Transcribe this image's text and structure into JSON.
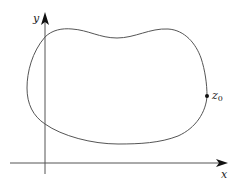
{
  "diagram": {
    "axes": {
      "x_label": "x",
      "y_label": "y"
    },
    "point": {
      "label": "z",
      "subscript": "0"
    },
    "colors": {
      "axis": "#555555",
      "curve": "#555555",
      "text": "#222222",
      "background": "#ffffff"
    }
  }
}
